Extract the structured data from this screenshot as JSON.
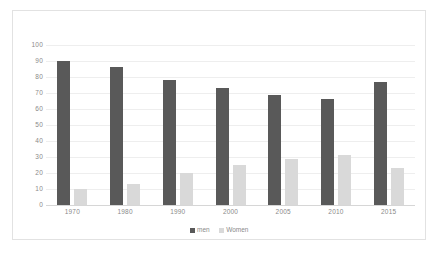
{
  "chart_data": {
    "type": "bar",
    "title": "",
    "xlabel": "",
    "ylabel": "",
    "categories": [
      "1970",
      "1980",
      "1990",
      "2000",
      "2005",
      "2010",
      "2015"
    ],
    "series": [
      {
        "name": "men",
        "color": "#595959",
        "values": [
          90,
          86,
          78,
          73,
          69,
          66,
          77
        ]
      },
      {
        "name": "Women",
        "color": "#d9d9d9",
        "values": [
          10,
          13,
          20,
          25,
          29,
          31,
          23
        ]
      }
    ],
    "ylim": [
      0,
      100
    ],
    "y_ticks": [
      "0",
      "10",
      "20",
      "30",
      "40",
      "50",
      "60",
      "70",
      "80",
      "90",
      "100"
    ],
    "grid": true,
    "legend_position": "bottom",
    "legend": [
      "men",
      "Women"
    ],
    "axis_label_color": "#8a8a8a",
    "gridline_color": "#eeeeee",
    "border_color": "#e2e2e2",
    "background": "#ffffff"
  }
}
